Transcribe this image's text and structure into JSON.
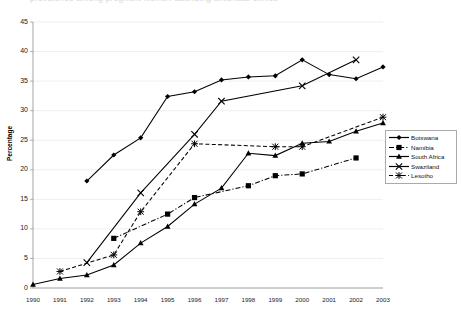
{
  "meta": {
    "clipped_title": "prevalence among pregnant women attending antenatal clinics",
    "background": "#ffffff"
  },
  "axes": {
    "ylabel": "Percentage",
    "yticks": [
      0,
      5,
      10,
      15,
      20,
      25,
      30,
      35,
      40,
      45
    ],
    "ylim": [
      0,
      45
    ],
    "xlabel": "",
    "xticks": [
      "1990",
      "1991",
      "1992",
      "1993",
      "1994",
      "1995",
      "1996",
      "1997",
      "1998",
      "1999",
      "2000",
      "2001",
      "2002",
      "2003"
    ],
    "grid": "horizontal",
    "grid_color": "#e8e8e8",
    "axis_color": "#9a9a9a"
  },
  "legend": {
    "position": "right",
    "items": [
      {
        "label": "Botswana",
        "marker": "diamond",
        "line": "solid",
        "color": "#000000"
      },
      {
        "label": "Namibia",
        "marker": "square",
        "line": "dashdot",
        "color": "#000000"
      },
      {
        "label": "South Africa",
        "marker": "triangle",
        "line": "solid",
        "color": "#000000"
      },
      {
        "label": "Swaziland",
        "marker": "cross",
        "line": "solid",
        "color": "#000000"
      },
      {
        "label": "Lesotho",
        "marker": "star",
        "line": "dashed",
        "color": "#000000"
      }
    ]
  },
  "chart_data": {
    "type": "line",
    "title": "",
    "xlabel": "",
    "ylabel": "Percentage",
    "ylim": [
      0,
      45
    ],
    "grid": true,
    "legend_position": "right",
    "categories": [
      "1990",
      "1991",
      "1992",
      "1993",
      "1994",
      "1995",
      "1996",
      "1997",
      "1998",
      "1999",
      "2000",
      "2001",
      "2002",
      "2003"
    ],
    "series": [
      {
        "name": "Botswana",
        "marker": "diamond",
        "line": "solid",
        "x": [
          "1992",
          "1993",
          "1994",
          "1995",
          "1996",
          "1997",
          "1998",
          "1999",
          "2000",
          "2001",
          "2002",
          "2003"
        ],
        "values": [
          18.1,
          22.5,
          25.4,
          32.4,
          33.2,
          35.2,
          35.7,
          35.9,
          38.6,
          36.1,
          35.4,
          37.4
        ]
      },
      {
        "name": "Namibia",
        "marker": "square",
        "line": "dashdot",
        "x": [
          "1993",
          "1995",
          "1996",
          "1998",
          "1999",
          "2000",
          "2002"
        ],
        "values": [
          8.4,
          12.5,
          15.3,
          17.3,
          19.0,
          19.3,
          22.0
        ]
      },
      {
        "name": "South Africa",
        "marker": "triangle",
        "line": "solid",
        "x": [
          "1990",
          "1991",
          "1992",
          "1993",
          "1994",
          "1995",
          "1996",
          "1997",
          "1998",
          "1999",
          "2000",
          "2001",
          "2002",
          "2003"
        ],
        "values": [
          0.6,
          1.6,
          2.2,
          3.9,
          7.6,
          10.4,
          14.2,
          16.9,
          22.8,
          22.4,
          24.5,
          24.8,
          26.5,
          27.9
        ]
      },
      {
        "name": "Swaziland",
        "marker": "cross",
        "line": "solid",
        "x": [
          "1992",
          "1994",
          "1996",
          "1997",
          "2000",
          "2002"
        ],
        "values": [
          4.3,
          16.1,
          26.0,
          31.6,
          34.2,
          38.6
        ]
      },
      {
        "name": "Lesotho",
        "marker": "star",
        "line": "dashed",
        "x": [
          "1991",
          "1993",
          "1994",
          "1996",
          "1999",
          "2000",
          "2003"
        ],
        "values": [
          2.8,
          5.6,
          12.9,
          24.4,
          23.9,
          23.9,
          28.9
        ]
      }
    ]
  }
}
